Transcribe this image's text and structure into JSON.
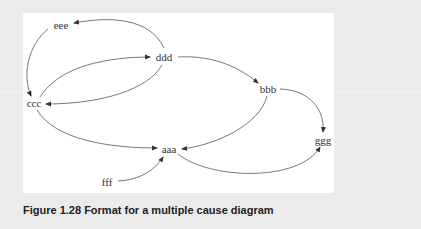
{
  "figure": {
    "caption": "Figure 1.28  Format for a multiple cause diagram",
    "nodes": {
      "aaa": "aaa",
      "bbb": "bbb",
      "ccc": "ccc",
      "ddd": "ddd",
      "eee": "eee",
      "fff": "fff",
      "ggg": "ggg"
    },
    "edges": [
      {
        "from": "ddd",
        "to": "eee"
      },
      {
        "from": "eee",
        "to": "ccc"
      },
      {
        "from": "ccc",
        "to": "ddd"
      },
      {
        "from": "ddd",
        "to": "ccc"
      },
      {
        "from": "ddd",
        "to": "bbb"
      },
      {
        "from": "bbb",
        "to": "ggg"
      },
      {
        "from": "bbb",
        "to": "aaa"
      },
      {
        "from": "ccc",
        "to": "aaa"
      },
      {
        "from": "aaa",
        "to": "ggg"
      },
      {
        "from": "fff",
        "to": "aaa"
      }
    ],
    "colors": {
      "background": "#ebebeb",
      "panel": "#ffffff",
      "stroke": "#555555",
      "text": "#333333"
    }
  }
}
